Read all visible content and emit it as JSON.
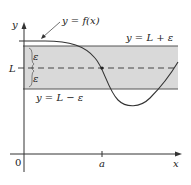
{
  "diagram": {
    "type": "epsilon-band limit illustration",
    "labels": {
      "y_axis": "y",
      "x_axis": "x",
      "origin": "0",
      "a_tick": "a",
      "L": "L",
      "epsilon_upper": "ε",
      "epsilon_lower": "ε",
      "curve": "y = f(x)",
      "upper_line": "y = L + ε",
      "lower_line": "y = L − ε"
    },
    "colors": {
      "band_fill": "#d9d9d9",
      "line": "#333333",
      "axis": "#333333"
    }
  }
}
